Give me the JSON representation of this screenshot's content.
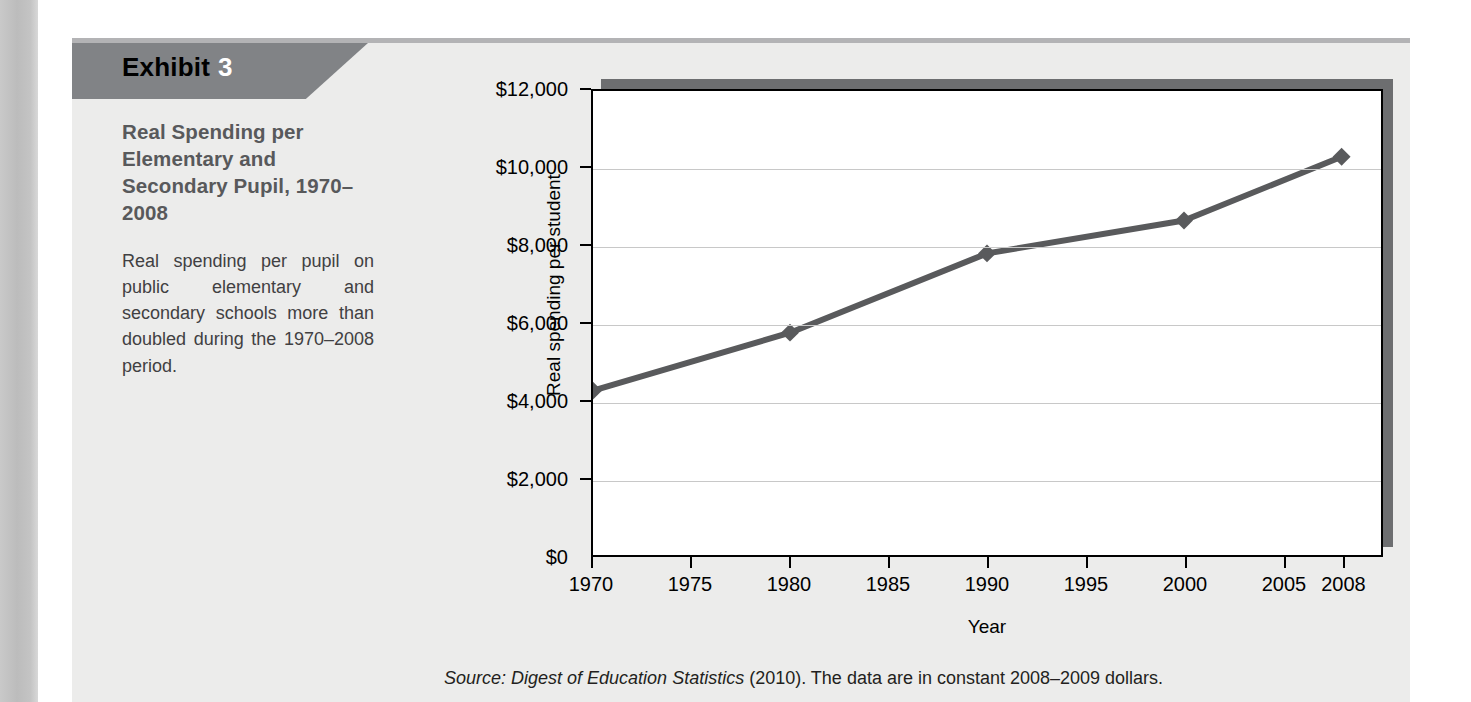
{
  "exhibit": {
    "tab_word": "Exhibit",
    "tab_number": "3",
    "title": "Real Spending per Elementary and Secondary Pupil, 1970–2008",
    "description": "Real spending per pupil on public elementary and secondary schools more than doubled during the 1970–2008 period.",
    "source_italic": "Source: Digest of Education Statistics",
    "source_rest": " (2010). The data are in constant 2008–2009 dollars."
  },
  "colors": {
    "tab_background": "#818386",
    "tab_number": "#ffffff",
    "panel_background": "#ececeb",
    "title_text": "#58595b",
    "series_line": "#595a5c",
    "plot_shadow": "#6d6e70",
    "gridline": "#c8c8c8",
    "gutter": "#bcbcbc"
  },
  "chart_data": {
    "type": "line",
    "title": "",
    "xlabel": "Year",
    "ylabel": "Real spending per student",
    "x": [
      1970,
      1980,
      1990,
      2000,
      2008
    ],
    "values": [
      4250,
      5750,
      7800,
      8650,
      10300
    ],
    "series": [
      {
        "name": "Real spending per student",
        "values": [
          4250,
          5750,
          7800,
          8650,
          10300
        ]
      }
    ],
    "ylim": [
      0,
      12000
    ],
    "yticks": [
      0,
      2000,
      4000,
      6000,
      8000,
      10000,
      12000
    ],
    "ytick_labels": [
      "$0",
      "$2,000",
      "$4,000",
      "$6,000",
      "$8,000",
      "$10,000",
      "$12,000"
    ],
    "xticks": [
      1970,
      1975,
      1980,
      1985,
      1990,
      1995,
      2000,
      2005,
      2008
    ],
    "xtick_labels": [
      "1970",
      "1975",
      "1980",
      "1985",
      "1990",
      "1995",
      "2000",
      "2005",
      "2008"
    ],
    "xtick_positions_pct": [
      0,
      12.5,
      25,
      37.5,
      50,
      62.5,
      75,
      87.5,
      95
    ],
    "grid": true,
    "legend": "none",
    "marker": "diamond"
  }
}
